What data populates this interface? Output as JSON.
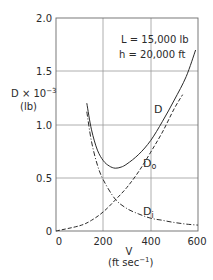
{
  "chart_data": {
    "type": "line",
    "title": "",
    "annotations": [
      "L = 15,000 lb",
      "h = 20,000 ft"
    ],
    "xlabel": "V",
    "xlabel_units": "(ft sec⁻¹)",
    "ylabel": "D × 10⁻³",
    "ylabel_units": "(lb)",
    "xlim": [
      0,
      600
    ],
    "ylim": [
      0,
      2.0
    ],
    "x_ticks": [
      "0",
      "200",
      "400",
      "600"
    ],
    "y_ticks": [
      "0",
      "0.5",
      "1.0",
      "1.5",
      "2.0"
    ],
    "grid": true,
    "series": [
      {
        "name": "D",
        "label": "D",
        "style": "solid",
        "x": [
          130,
          150,
          175,
          200,
          225,
          250,
          275,
          300,
          350,
          400,
          450,
          500,
          550,
          590
        ],
        "values": [
          1.2,
          0.95,
          0.76,
          0.66,
          0.61,
          0.59,
          0.6,
          0.63,
          0.72,
          0.85,
          1.03,
          1.23,
          1.45,
          1.7
        ]
      },
      {
        "name": "D0",
        "label": "D₀",
        "style": "dashed",
        "x": [
          0,
          100,
          150,
          200,
          250,
          300,
          350,
          400,
          450,
          500,
          535
        ],
        "values": [
          0.0,
          0.05,
          0.1,
          0.18,
          0.29,
          0.41,
          0.56,
          0.74,
          0.93,
          1.15,
          1.28
        ]
      },
      {
        "name": "Di",
        "label": "Dᵢ",
        "style": "dash-dot",
        "x": [
          130,
          150,
          175,
          200,
          250,
          300,
          350,
          400,
          450,
          500,
          550,
          600
        ],
        "values": [
          1.12,
          0.84,
          0.62,
          0.48,
          0.3,
          0.21,
          0.16,
          0.12,
          0.1,
          0.08,
          0.065,
          0.055
        ]
      }
    ]
  },
  "labels": {
    "annotation_L": "L = 15,000 lb",
    "annotation_h": "h = 20,000 ft",
    "ylabel_main": "D × 10",
    "ylabel_exp": "−3",
    "ylabel_units": "(lb)",
    "xlabel_main": "V",
    "xlabel_units_pre": "(ft sec",
    "xlabel_units_exp": "−1",
    "xlabel_units_post": ")",
    "curve_D": "D",
    "curve_D0_main": "D",
    "curve_D0_sub": "o",
    "curve_Di_main": "D",
    "curve_Di_sub": "i",
    "xtick_0": "0",
    "xtick_200": "200",
    "xtick_400": "400",
    "xtick_600": "600",
    "ytick_0": "0",
    "ytick_05": "0.5",
    "ytick_10": "1.0",
    "ytick_15": "1.5",
    "ytick_20": "2.0"
  },
  "colors": {
    "line": "#2a2a2a",
    "grid": "#9a9a9a",
    "background": "#ffffff"
  }
}
